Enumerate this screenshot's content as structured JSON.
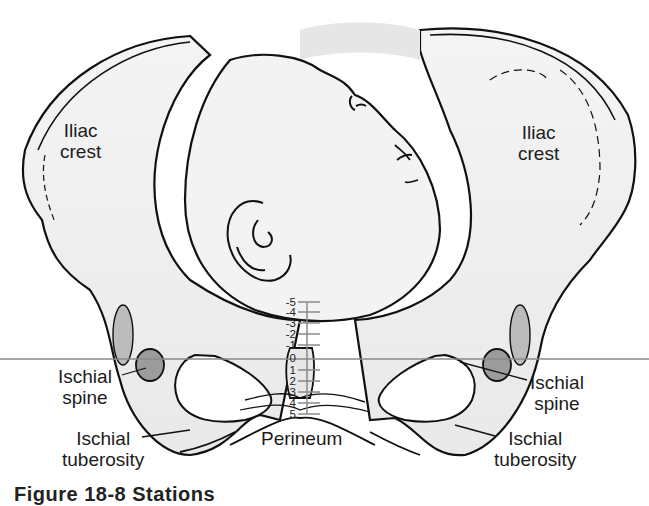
{
  "figure": {
    "caption_partial": "Figure 18-8 Stations"
  },
  "labels": {
    "iliac_crest_left": [
      "Iliac",
      "crest"
    ],
    "iliac_crest_right": [
      "Iliac",
      "crest"
    ],
    "ischial_spine_left": [
      "Ischial",
      "spine"
    ],
    "ischial_spine_right": [
      "Ischial",
      "spine"
    ],
    "ischial_tuberosity_left": [
      "Ischial",
      "tuberosity"
    ],
    "ischial_tuberosity_right": [
      "Ischial",
      "tuberosity"
    ],
    "perineum": "Perineum"
  },
  "station_scale": {
    "ticks": [
      "-5",
      "-4",
      "-3",
      "-2",
      "-1",
      "0",
      "1",
      "2",
      "3",
      "4",
      "5"
    ],
    "zero_reference": "ischial spines"
  },
  "colors": {
    "line": "#111111",
    "bone_fill": "#f1f1f1",
    "shadow": "#c9c9c9",
    "scale_line": "#8a8a8a"
  }
}
